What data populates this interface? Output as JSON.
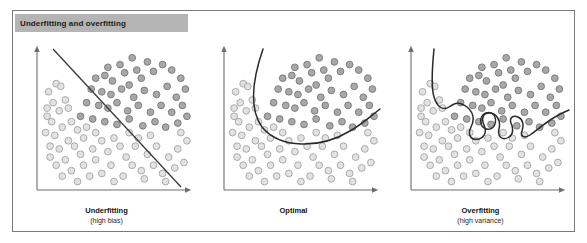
{
  "figure": {
    "title": "Underfitting and overfitting",
    "title_bar_color": "#b4b4b4",
    "frame_color": "#7a7a7a",
    "background": "#ffffff"
  },
  "legend_classes": {
    "class_a_label": "dark-class",
    "class_a_fill": "#a8a8a8",
    "class_a_stroke": "#6e6e6e",
    "class_b_label": "light-class",
    "class_b_fill": "#e2e2e2",
    "class_b_stroke": "#9a9a9a"
  },
  "panels": [
    {
      "id": "underfitting",
      "caption": "Underfitting",
      "subcaption": "(high bias)",
      "boundary_type": "straight-line",
      "boundary_description": "Single straight diagonal decision boundary from upper-left to lower-right",
      "axis_color": "#6e6e6e",
      "boundary_color": "#3a3a3a"
    },
    {
      "id": "optimal",
      "caption": "Optimal",
      "subcaption": "",
      "boundary_type": "smooth-curve",
      "boundary_description": "Smooth parabola-like curve separating the two classes",
      "axis_color": "#6e6e6e",
      "boundary_color": "#2a2a2a"
    },
    {
      "id": "overfitting",
      "caption": "Overfitting",
      "subcaption": "(high variance)",
      "boundary_type": "wiggly-curve-with-loop",
      "boundary_description": "Highly irregular wiggly boundary with a closed loop isolating individual points",
      "axis_color": "#6e6e6e",
      "boundary_color": "#2a2a2a"
    }
  ],
  "scatter_data": {
    "type": "scatter",
    "note": "Two-class 2-D scatter, identical point cloud reused in all three panels",
    "dark_points": [
      [
        0.44,
        0.88
      ],
      [
        0.52,
        0.9
      ],
      [
        0.6,
        0.95
      ],
      [
        0.63,
        0.86
      ],
      [
        0.7,
        0.92
      ],
      [
        0.36,
        0.8
      ],
      [
        0.42,
        0.82
      ],
      [
        0.47,
        0.78
      ],
      [
        0.55,
        0.84
      ],
      [
        0.58,
        0.75
      ],
      [
        0.66,
        0.8
      ],
      [
        0.74,
        0.85
      ],
      [
        0.8,
        0.9
      ],
      [
        0.86,
        0.86
      ],
      [
        0.92,
        0.8
      ],
      [
        0.33,
        0.72
      ],
      [
        0.4,
        0.7
      ],
      [
        0.46,
        0.68
      ],
      [
        0.53,
        0.72
      ],
      [
        0.61,
        0.66
      ],
      [
        0.68,
        0.71
      ],
      [
        0.76,
        0.68
      ],
      [
        0.83,
        0.74
      ],
      [
        0.89,
        0.66
      ],
      [
        0.95,
        0.72
      ],
      [
        0.3,
        0.62
      ],
      [
        0.38,
        0.6
      ],
      [
        0.44,
        0.58
      ],
      [
        0.5,
        0.62
      ],
      [
        0.57,
        0.56
      ],
      [
        0.64,
        0.6
      ],
      [
        0.72,
        0.55
      ],
      [
        0.79,
        0.6
      ],
      [
        0.86,
        0.55
      ],
      [
        0.93,
        0.6
      ],
      [
        0.42,
        0.48
      ],
      [
        0.5,
        0.46
      ],
      [
        0.58,
        0.5
      ],
      [
        0.67,
        0.45
      ],
      [
        0.75,
        0.48
      ],
      [
        0.82,
        0.44
      ],
      [
        0.9,
        0.47
      ],
      [
        0.96,
        0.52
      ],
      [
        0.26,
        0.52
      ],
      [
        0.34,
        0.5
      ]
    ],
    "light_points": [
      [
        0.05,
        0.7
      ],
      [
        0.1,
        0.76
      ],
      [
        0.13,
        0.74
      ],
      [
        0.08,
        0.62
      ],
      [
        0.04,
        0.58
      ],
      [
        0.04,
        0.52
      ],
      [
        0.07,
        0.48
      ],
      [
        0.12,
        0.56
      ],
      [
        0.16,
        0.64
      ],
      [
        0.18,
        0.58
      ],
      [
        0.03,
        0.4
      ],
      [
        0.09,
        0.38
      ],
      [
        0.14,
        0.44
      ],
      [
        0.2,
        0.48
      ],
      [
        0.24,
        0.42
      ],
      [
        0.06,
        0.3
      ],
      [
        0.12,
        0.28
      ],
      [
        0.18,
        0.34
      ],
      [
        0.22,
        0.3
      ],
      [
        0.28,
        0.36
      ],
      [
        0.3,
        0.44
      ],
      [
        0.36,
        0.4
      ],
      [
        0.4,
        0.34
      ],
      [
        0.34,
        0.28
      ],
      [
        0.26,
        0.24
      ],
      [
        0.16,
        0.2
      ],
      [
        0.1,
        0.16
      ],
      [
        0.2,
        0.12
      ],
      [
        0.28,
        0.16
      ],
      [
        0.36,
        0.2
      ],
      [
        0.44,
        0.26
      ],
      [
        0.48,
        0.36
      ],
      [
        0.52,
        0.3
      ],
      [
        0.46,
        0.16
      ],
      [
        0.4,
        0.1
      ],
      [
        0.56,
        0.22
      ],
      [
        0.62,
        0.3
      ],
      [
        0.6,
        0.16
      ],
      [
        0.54,
        0.08
      ],
      [
        0.66,
        0.12
      ],
      [
        0.7,
        0.24
      ],
      [
        0.76,
        0.3
      ],
      [
        0.74,
        0.16
      ],
      [
        0.68,
        0.06
      ],
      [
        0.8,
        0.1
      ],
      [
        0.84,
        0.22
      ],
      [
        0.9,
        0.28
      ],
      [
        0.88,
        0.14
      ],
      [
        0.82,
        0.04
      ],
      [
        0.94,
        0.18
      ],
      [
        0.96,
        0.34
      ],
      [
        0.58,
        0.4
      ],
      [
        0.64,
        0.36
      ],
      [
        0.32,
        0.08
      ],
      [
        0.24,
        0.04
      ],
      [
        0.48,
        0.04
      ],
      [
        0.72,
        0.38
      ],
      [
        0.92,
        0.4
      ],
      [
        0.14,
        0.08
      ],
      [
        0.06,
        0.22
      ]
    ]
  }
}
